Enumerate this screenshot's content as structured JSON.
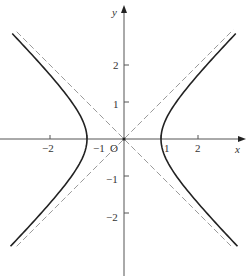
{
  "figure": {
    "equation": "x^2 - y^2 = 1",
    "asymptotes": [
      "y = x",
      "y = -x"
    ]
  },
  "axes": {
    "x_label": "x",
    "y_label": "y",
    "origin_label": "O",
    "x_ticks": [
      {
        "value": -2,
        "label": "−2"
      },
      {
        "value": -1,
        "label": "−1"
      },
      {
        "value": 1,
        "label": "1"
      },
      {
        "value": 2,
        "label": "2"
      }
    ],
    "y_ticks": [
      {
        "value": 2,
        "label": "2"
      },
      {
        "value": 1,
        "label": "1"
      },
      {
        "value": -1,
        "label": "−1"
      },
      {
        "value": -2,
        "label": "−2"
      }
    ]
  },
  "chart_data": {
    "type": "line",
    "title": "",
    "xlabel": "x",
    "ylabel": "y",
    "xlim": [
      -3.1,
      3.2
    ],
    "ylim": [
      -3.7,
      3.5
    ],
    "grid": false,
    "series": [
      {
        "name": "hyperbola right branch",
        "style": "solid",
        "equation": "x = sqrt(1 + y^2)",
        "y_range": [
          -2.9,
          2.85
        ]
      },
      {
        "name": "hyperbola left branch",
        "style": "solid",
        "equation": "x = -sqrt(1 + y^2)",
        "y_range": [
          -2.9,
          2.85
        ]
      },
      {
        "name": "asymptote y = x",
        "style": "dashed",
        "x_range": [
          -2.9,
          2.95
        ]
      },
      {
        "name": "asymptote y = -x",
        "style": "dashed",
        "x_range": [
          -2.9,
          2.95
        ]
      }
    ]
  },
  "colors": {
    "curve": "#222222",
    "asymptote": "#9a9a9a",
    "axis": "#555555",
    "text": "#333333"
  }
}
